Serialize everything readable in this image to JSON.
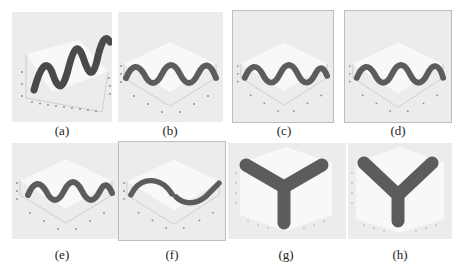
{
  "figure": {
    "panels": [
      {
        "id": "a",
        "caption": "(a)",
        "view": "perspective, tilted",
        "content": "sine-wave tube, 3 periods, rising"
      },
      {
        "id": "b",
        "caption": "(b)",
        "view": "isometric",
        "content": "sine-wave tube, 3 periods"
      },
      {
        "id": "c",
        "caption": "(c)",
        "view": "isometric",
        "content": "sine-wave tube, 3 periods"
      },
      {
        "id": "d",
        "caption": "(d)",
        "view": "isometric",
        "content": "sine-wave tube, 3 periods"
      },
      {
        "id": "e",
        "caption": "(e)",
        "view": "isometric",
        "content": "sine-wave tube, 3 periods"
      },
      {
        "id": "f",
        "caption": "(f)",
        "view": "isometric",
        "content": "sine-wave tube, 1 period, split at middle"
      },
      {
        "id": "g",
        "caption": "(g)",
        "view": "top-down",
        "content": "Y-shaped projection"
      },
      {
        "id": "h",
        "caption": "(h)",
        "view": "top-down",
        "content": "Y-shaped projection"
      }
    ],
    "colors": {
      "panel_bg": "#ececec",
      "box_face": "#f8f8f8",
      "tube": "#5c5c5c",
      "tube_edge": "#3f3f3f",
      "axis": "#9a9a9a",
      "caption": "#222222"
    }
  }
}
